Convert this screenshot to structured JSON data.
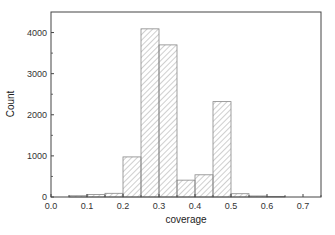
{
  "chart_data": {
    "type": "bar",
    "subtype": "histogram",
    "title": "",
    "xlabel": "coverage",
    "ylabel": "Count",
    "xlim": [
      0.0,
      0.75
    ],
    "ylim": [
      0,
      4500
    ],
    "xticks": [
      "0.0",
      "0.1",
      "0.2",
      "0.3",
      "0.4",
      "0.5",
      "0.6",
      "0.7"
    ],
    "yticks": [
      "0",
      "1000",
      "2000",
      "3000",
      "4000"
    ],
    "bin_width": 0.05,
    "bins": [
      {
        "start": 0.05,
        "end": 0.1,
        "count": 30
      },
      {
        "start": 0.1,
        "end": 0.15,
        "count": 60
      },
      {
        "start": 0.15,
        "end": 0.2,
        "count": 90
      },
      {
        "start": 0.2,
        "end": 0.25,
        "count": 975
      },
      {
        "start": 0.25,
        "end": 0.3,
        "count": 4090
      },
      {
        "start": 0.3,
        "end": 0.35,
        "count": 3700
      },
      {
        "start": 0.35,
        "end": 0.4,
        "count": 410
      },
      {
        "start": 0.4,
        "end": 0.45,
        "count": 540
      },
      {
        "start": 0.45,
        "end": 0.5,
        "count": 2320
      },
      {
        "start": 0.5,
        "end": 0.55,
        "count": 80
      },
      {
        "start": 0.55,
        "end": 0.6,
        "count": 25
      },
      {
        "start": 0.6,
        "end": 0.65,
        "count": 15
      }
    ],
    "categories": [
      "0.05-0.10",
      "0.10-0.15",
      "0.15-0.20",
      "0.20-0.25",
      "0.25-0.30",
      "0.30-0.35",
      "0.35-0.40",
      "0.40-0.45",
      "0.45-0.50",
      "0.50-0.55",
      "0.55-0.60",
      "0.60-0.65"
    ],
    "values": [
      30,
      60,
      90,
      975,
      4090,
      3700,
      410,
      540,
      2320,
      80,
      25,
      15
    ],
    "grid": false,
    "legend": null,
    "bar_style": "diagonal hatch",
    "colors": {
      "bar_edge": "#888888",
      "hatch": "#9a9a9a",
      "axis": "#444444"
    }
  }
}
